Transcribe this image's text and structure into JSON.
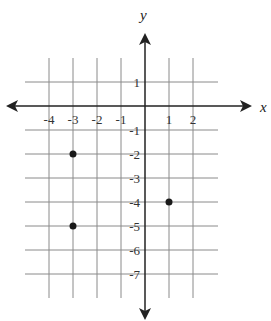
{
  "chart_data": {
    "type": "scatter",
    "title": "",
    "xlabel": "x",
    "ylabel": "y",
    "xlim": [
      -5,
      3
    ],
    "ylim": [
      -8,
      2
    ],
    "grid": true,
    "x_ticks": [
      "-4",
      "-3",
      "-2",
      "-1",
      "1",
      "2"
    ],
    "y_ticks": [
      "1",
      "-1",
      "-2",
      "-3",
      "-4",
      "-5",
      "-6",
      "-7"
    ],
    "points": [
      {
        "x": -3,
        "y": -2
      },
      {
        "x": -3,
        "y": -5
      },
      {
        "x": 1,
        "y": -4
      }
    ]
  },
  "colors": {
    "grid": "#8a8a8a",
    "axis": "#222222",
    "point": "#1a1a1a"
  }
}
